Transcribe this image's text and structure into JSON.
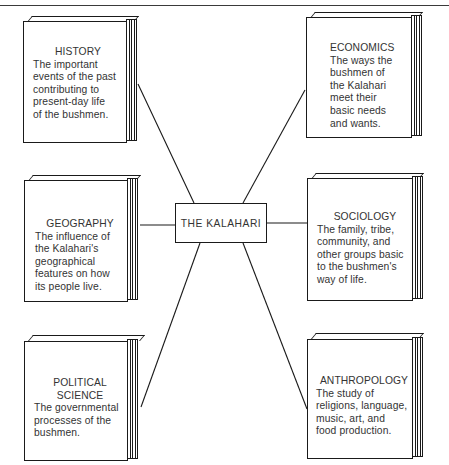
{
  "diagram": {
    "center": {
      "label": "THE KALAHARI"
    },
    "books": [
      {
        "id": "history",
        "title": "HISTORY",
        "description": "The important\nevents of the past\ncontributing to\npresent-day life\nof the bushmen."
      },
      {
        "id": "economics",
        "title": "ECONOMICS",
        "description": "The ways the\nbushmen of\nthe Kalahari\nmeet their\nbasic needs\nand wants."
      },
      {
        "id": "geography",
        "title": "GEOGRAPHY",
        "description": "The influence of\nthe Kalahari's\ngeographical\nfeatures on how\nits people live."
      },
      {
        "id": "sociology",
        "title": "SOCIOLOGY",
        "description": "The family, tribe,\ncommunity, and\nother groups basic\nto the bushmen's\nway of life."
      },
      {
        "id": "political-science",
        "title": "POLITICAL\nSCIENCE",
        "description": "The governmental\nprocesses of the\nbushmen."
      },
      {
        "id": "anthropology",
        "title": "ANTHROPOLOGY",
        "description": "The study of\nreligions, language,\nmusic, art, and\nfood production."
      }
    ],
    "connections": [
      {
        "from": "THE KALAHARI",
        "to": "HISTORY"
      },
      {
        "from": "THE KALAHARI",
        "to": "ECONOMICS"
      },
      {
        "from": "THE KALAHARI",
        "to": "GEOGRAPHY"
      },
      {
        "from": "THE KALAHARI",
        "to": "SOCIOLOGY"
      },
      {
        "from": "THE KALAHARI",
        "to": "POLITICAL SCIENCE"
      },
      {
        "from": "THE KALAHARI",
        "to": "ANTHROPOLOGY"
      }
    ],
    "colors": {
      "ink": "#1a1a1a",
      "text": "#333333",
      "background": "#ffffff"
    }
  }
}
